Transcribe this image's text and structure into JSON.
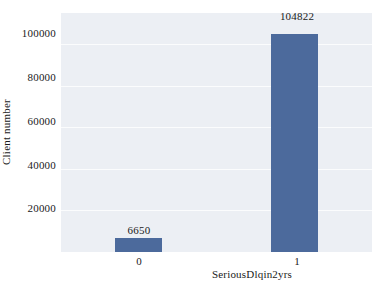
{
  "chart_data": {
    "type": "bar",
    "title": "",
    "xlabel": "SeriousDlqin2yrs",
    "ylabel": "Client number",
    "categories": [
      "0",
      "1"
    ],
    "values": [
      6650,
      104822
    ],
    "value_labels": [
      "6650",
      "104822"
    ],
    "yticks": [
      20000,
      40000,
      60000,
      80000,
      100000
    ],
    "ytick_labels": [
      "20000",
      "40000",
      "60000",
      "80000",
      "100000"
    ],
    "ylim": [
      0,
      115000
    ],
    "grid": true,
    "legend": null,
    "bar_color": "#4c6a9c",
    "panel_color": "#eceff4",
    "gridline_color": "#fbfcfd"
  }
}
